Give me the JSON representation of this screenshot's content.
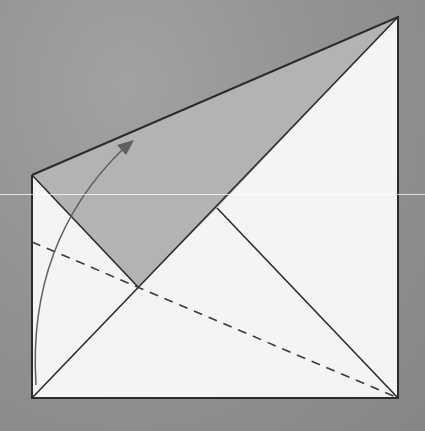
{
  "diagram": {
    "title": "",
    "type": "origami-fold-step",
    "colors": {
      "background": "#909090",
      "paper_white": "#f4f4f4",
      "paper_shaded": "#b3b3b3",
      "line": "#2b2b2b",
      "arrow": "#5a5a5a"
    },
    "points": {
      "bottom_left": [
        32,
        398
      ],
      "bottom_right": [
        398,
        398
      ],
      "top_right": [
        398,
        17
      ],
      "left_top": [
        32,
        175
      ],
      "inner_vertex": [
        138,
        287
      ],
      "edge_cross": [
        217,
        208
      ],
      "dash_start": [
        32,
        242
      ],
      "dash_end": [
        398,
        398
      ]
    },
    "elements": [
      {
        "name": "white-paper-region",
        "kind": "polygon"
      },
      {
        "name": "shaded-flap",
        "kind": "polygon"
      },
      {
        "name": "diagonal-crease",
        "kind": "line"
      },
      {
        "name": "valley-fold-line",
        "kind": "dashed-line"
      },
      {
        "name": "fold-arrow",
        "kind": "curved-arrow"
      }
    ],
    "labels": []
  }
}
